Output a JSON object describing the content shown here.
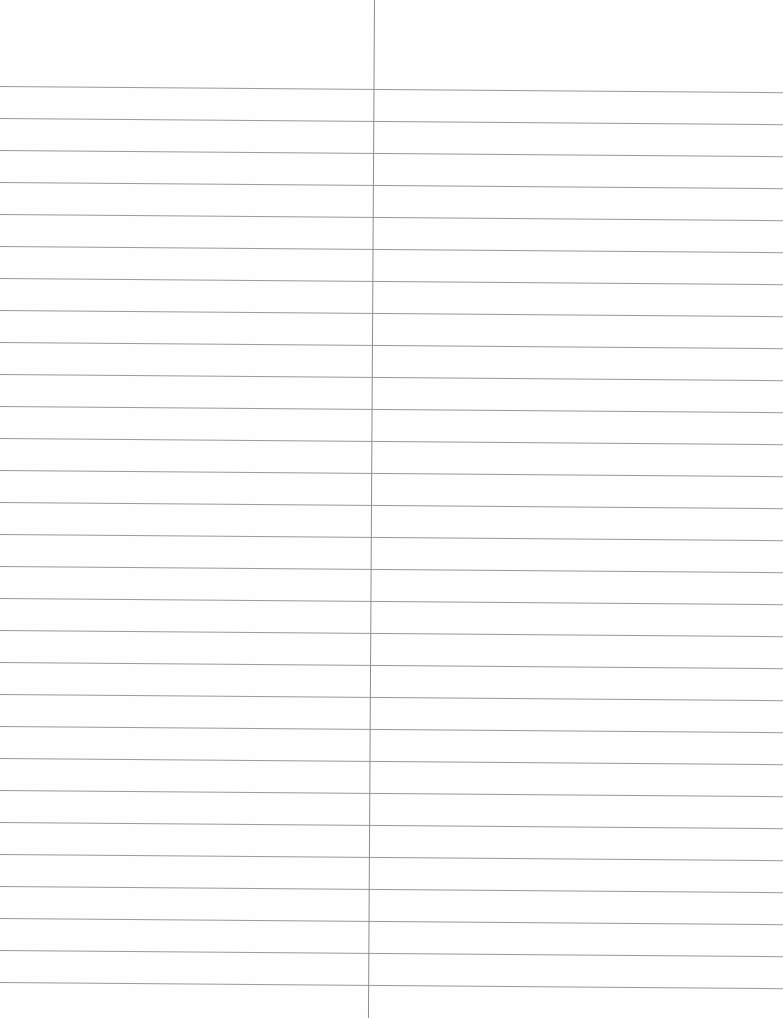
{
  "page": {
    "type": "blank ruled sheet",
    "columns": 2,
    "ruled_line_count": 29,
    "line_spacing_px": 32,
    "first_line_y_px": 86,
    "colors": {
      "paper": "#fefefe",
      "rule_line": "#9a9a9a",
      "column_divider": "#8e8e8e"
    }
  },
  "left_column": {
    "text": ""
  },
  "right_column": {
    "text": ""
  }
}
